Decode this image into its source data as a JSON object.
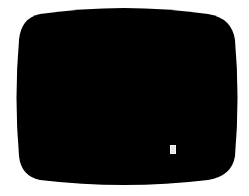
{
  "screen": {
    "shape": "crt-display",
    "fill_color": "#000000",
    "background_color": "#ffffff"
  },
  "cursor": {
    "icon": "text-cursor-block",
    "color": "#e6e6e6"
  }
}
